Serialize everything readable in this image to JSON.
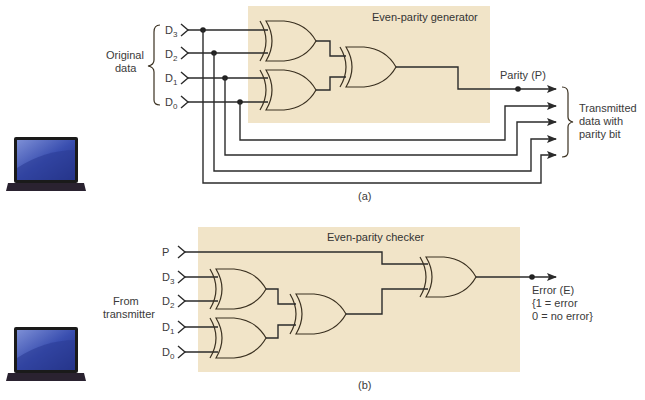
{
  "diagram_a": {
    "title": "Even-parity generator",
    "caption": "(a)",
    "group_label_line1": "Original",
    "group_label_line2": "data",
    "inputs": [
      {
        "name": "D",
        "sub": "3"
      },
      {
        "name": "D",
        "sub": "2"
      },
      {
        "name": "D",
        "sub": "1"
      },
      {
        "name": "D",
        "sub": "0"
      }
    ],
    "parity_label": "Parity (P)",
    "output_label_line1": "Transmitted",
    "output_label_line2": "data with",
    "output_label_line3": "parity bit"
  },
  "diagram_b": {
    "title": "Even-parity checker",
    "caption": "(b)",
    "group_label_line1": "From",
    "group_label_line2": "transmitter",
    "p_input": "P",
    "inputs": [
      {
        "name": "D",
        "sub": "3"
      },
      {
        "name": "D",
        "sub": "2"
      },
      {
        "name": "D",
        "sub": "1"
      },
      {
        "name": "D",
        "sub": "0"
      }
    ],
    "error_label": "Error (E)",
    "error_line2": "{1 = error",
    "error_line3": "0 = no error}"
  },
  "colors": {
    "panel": "#f1e4c8",
    "wire": "#2b2b2b"
  }
}
